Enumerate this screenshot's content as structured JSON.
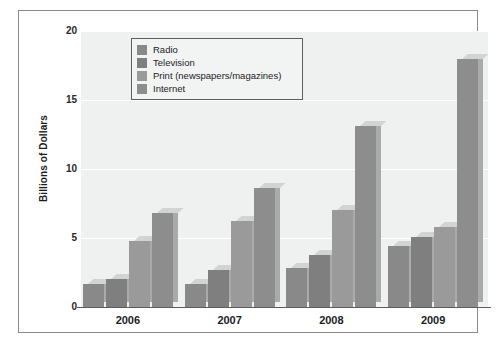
{
  "chart_data": {
    "type": "bar",
    "title": "",
    "subtitle": "",
    "xlabel": "",
    "ylabel": "Billions of Dollars",
    "categories": [
      "2006",
      "2007",
      "2008",
      "2009"
    ],
    "series": [
      {
        "name": "Radio",
        "color": "#898989",
        "values": [
          1.7,
          1.7,
          2.8,
          4.4
        ]
      },
      {
        "name": "Television",
        "color": "#7f7f7f",
        "values": [
          2.0,
          2.7,
          3.8,
          5.1
        ]
      },
      {
        "name": "Print (newspapers/magazines)",
        "color": "#9a9a9a",
        "values": [
          4.8,
          6.2,
          7.0,
          5.8
        ]
      },
      {
        "name": "Internet",
        "color": "#8d8d8d",
        "values": [
          6.8,
          8.6,
          13.1,
          18.0
        ]
      }
    ],
    "ylim": [
      0,
      20
    ],
    "yticks": [
      0,
      5,
      10,
      15,
      20
    ],
    "ytick_labels": [
      "0",
      "5",
      "10",
      "15",
      "20"
    ],
    "grid": true,
    "grid_color": "#ffffff",
    "legend_position": "upper-left",
    "plot_background": "#eff0f0",
    "figure_background": "#ffffff",
    "style": "3d-bars"
  }
}
